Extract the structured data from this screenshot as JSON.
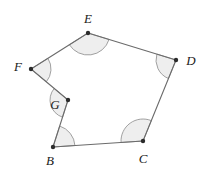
{
  "figure": {
    "type": "polygon-angle-diagram",
    "shape_name": "BCDEFG",
    "sides": 6,
    "background_color": "#ffffff",
    "stroke_color": "#6b6b6b",
    "vertex_dot_color": "#2b2b2b",
    "arc_fill_color": "#eeeeee",
    "arc_stroke_color": "#8a8a8a",
    "label_color": "#1a1a1a",
    "canvas": {
      "width": 205,
      "height": 171
    },
    "vertices": [
      {
        "id": "B",
        "label": "B",
        "x": 53,
        "y": 147,
        "label_x": 50,
        "label_y": 160,
        "angle_marked": true,
        "angle_type": "interior",
        "arc_radius": 22
      },
      {
        "id": "C",
        "label": "C",
        "x": 143,
        "y": 141,
        "label_x": 143,
        "label_y": 158,
        "angle_marked": true,
        "angle_type": "interior",
        "arc_radius": 22
      },
      {
        "id": "D",
        "label": "D",
        "x": 176,
        "y": 60,
        "label_x": 191,
        "label_y": 60,
        "angle_marked": true,
        "angle_type": "interior",
        "arc_radius": 20
      },
      {
        "id": "E",
        "label": "E",
        "x": 88,
        "y": 33,
        "label_x": 88,
        "label_y": 18,
        "angle_marked": true,
        "angle_type": "interior",
        "arc_radius": 22
      },
      {
        "id": "F",
        "label": "F",
        "x": 31,
        "y": 69,
        "label_x": 18,
        "label_y": 66,
        "angle_marked": true,
        "angle_type": "interior",
        "arc_radius": 20
      },
      {
        "id": "G",
        "label": "G",
        "x": 68,
        "y": 100,
        "label_x": 55,
        "label_y": 104,
        "angle_marked": true,
        "angle_type": "reflex",
        "arc_radius": 18
      }
    ],
    "edges": [
      {
        "from": "B",
        "to": "C"
      },
      {
        "from": "C",
        "to": "D"
      },
      {
        "from": "D",
        "to": "E"
      },
      {
        "from": "E",
        "to": "F"
      },
      {
        "from": "F",
        "to": "G"
      },
      {
        "from": "G",
        "to": "B"
      }
    ]
  }
}
